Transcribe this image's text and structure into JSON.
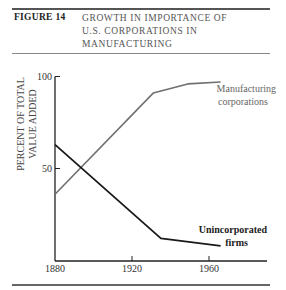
{
  "figure": {
    "label": "FIGURE 14",
    "title_lines": [
      "GROWTH IN IMPORTANCE OF",
      "U.S. CORPORATIONS IN",
      "MANUFACTURING"
    ]
  },
  "chart_data": {
    "type": "line",
    "title": "Growth in Importance of U.S. Corporations in Manufacturing",
    "xlabel": "",
    "ylabel": "PERCENT OF TOTAL VALUE ADDED",
    "ylabel_lines": [
      "PERCENT OF TOTAL",
      "VALUE ADDED"
    ],
    "x_ticks": [
      1880,
      1920,
      1960
    ],
    "y_ticks": [
      50,
      100
    ],
    "xlim": [
      1880,
      1980
    ],
    "ylim": [
      0,
      100
    ],
    "grid": false,
    "legend": "inline labels at line ends",
    "series": [
      {
        "name": "Manufacturing corporations",
        "label_lines": [
          "Manufacturing",
          "corporations"
        ],
        "color": "#707070",
        "x": [
          1880,
          1931,
          1949,
          1966
        ],
        "values": [
          36,
          91,
          96,
          97
        ]
      },
      {
        "name": "Unincorporated firms",
        "label_lines": [
          "Unincorporated",
          "firms"
        ],
        "color": "#1a1a1a",
        "x": [
          1880,
          1935,
          1966
        ],
        "values": [
          63,
          12,
          8
        ]
      }
    ]
  },
  "colors": {
    "rule": "#555555",
    "axis": "#222222",
    "manufacturing_line": "#707070",
    "unincorporated_line": "#1a1a1a"
  }
}
